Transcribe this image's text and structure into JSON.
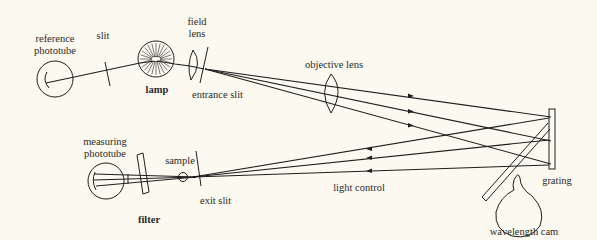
{
  "labels": {
    "reference_phototube_line1": "reference",
    "reference_phototube_line2": "phototube",
    "slit": "slit",
    "lamp": "lamp",
    "field_lens_line1": "field",
    "field_lens_line2": "lens",
    "entrance_slit": "entrance slit",
    "objective_lens": "objective lens",
    "grating": "grating",
    "wavelength_cam": "wavelength cam",
    "measuring_phototube_line1": "measuring",
    "measuring_phototube_line2": "phototube",
    "sample": "sample",
    "exit_slit": "exit slit",
    "filter": "filter",
    "light_control": "light control"
  },
  "components": [
    {
      "id": "reference-phototube",
      "type": "phototube"
    },
    {
      "id": "slit",
      "type": "slit"
    },
    {
      "id": "lamp",
      "type": "light-source"
    },
    {
      "id": "field-lens",
      "type": "lens"
    },
    {
      "id": "entrance-slit",
      "type": "slit"
    },
    {
      "id": "objective-lens",
      "type": "lens"
    },
    {
      "id": "grating",
      "type": "diffraction-grating"
    },
    {
      "id": "wavelength-cam",
      "type": "cam"
    },
    {
      "id": "exit-slit",
      "type": "slit"
    },
    {
      "id": "sample",
      "type": "sample-cell"
    },
    {
      "id": "filter",
      "type": "filter"
    },
    {
      "id": "measuring-phototube",
      "type": "phototube"
    }
  ],
  "connections": [
    {
      "from": "lamp",
      "to": "reference-phototube",
      "via": "slit"
    },
    {
      "from": "lamp",
      "to": "field-lens"
    },
    {
      "from": "field-lens",
      "to": "entrance-slit"
    },
    {
      "from": "entrance-slit",
      "to": "grating",
      "via": "objective-lens",
      "rays": 3,
      "direction": "forward"
    },
    {
      "from": "grating",
      "to": "exit-slit",
      "rays": 3,
      "direction": "return",
      "label": "light control"
    },
    {
      "from": "exit-slit",
      "to": "sample"
    },
    {
      "from": "sample",
      "to": "filter"
    },
    {
      "from": "filter",
      "to": "measuring-phototube"
    },
    {
      "from": "wavelength-cam",
      "to": "grating",
      "type": "mechanical"
    }
  ]
}
